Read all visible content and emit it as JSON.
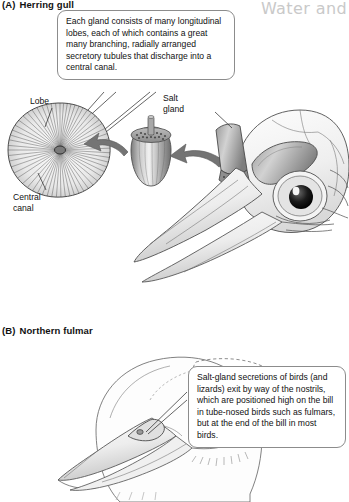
{
  "page": {
    "running_head": "Water and",
    "figure_type": "two-panel anatomical illustration"
  },
  "panels": [
    {
      "tag": "(A)",
      "title": "Herring gull",
      "callout": "Each gland consists of many longitudinal lobes, each of which contains a great many branching, radially arranged secretory tubules that discharge into a central canal.",
      "labels": {
        "lobe": "Lobe",
        "central_canal": "Central\ncanal",
        "salt_gland": "Salt\ngland"
      }
    },
    {
      "tag": "(B)",
      "title": "Northern fulmar",
      "callout": "Salt-gland secretions of birds (and lizards) exit by way of the nostrils, which are positioned high on the bill in tube-nosed birds such as fulmars, but at the end of the bill in most birds."
    }
  ],
  "colors": {
    "ink": "#111111",
    "outline": "#5a5a5a",
    "running_head": "#c9c9c9",
    "callout_border": "#8c8c8c",
    "gland_gray": "#8f8f8f",
    "arrow_gray": "#6f6f6f"
  }
}
